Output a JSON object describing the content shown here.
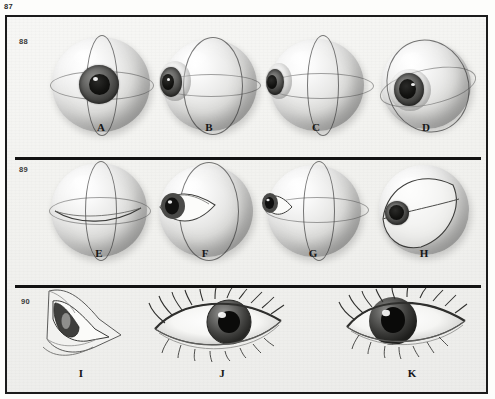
{
  "page": {
    "plate_number": "87",
    "background_color": "#f4f4f1",
    "border_color": "#1b1b1b"
  },
  "rows": [
    {
      "figure_number": "88",
      "description": "Eyeball globe rotations with meridian rings, front to lateral",
      "items": [
        {
          "label": "A",
          "view": "anterior-front",
          "iris_visible": true,
          "iris_position": "center"
        },
        {
          "label": "B",
          "view": "rotated-left",
          "iris_visible": true,
          "iris_position": "left-edge"
        },
        {
          "label": "C",
          "view": "rotated-far-left",
          "iris_visible": true,
          "iris_position": "far-left-edge"
        },
        {
          "label": "D",
          "view": "tilted-oblique",
          "iris_visible": true,
          "iris_position": "lower-left"
        }
      ]
    },
    {
      "figure_number": "89",
      "description": "Eyeball globe with palpebral aperture and lids in successive rotations",
      "items": [
        {
          "label": "E",
          "view": "posterior-no-aperture",
          "iris_visible": false,
          "iris_position": "none"
        },
        {
          "label": "F",
          "view": "aperture-three-quarter",
          "iris_visible": true,
          "iris_position": "left"
        },
        {
          "label": "G",
          "view": "aperture-lateral",
          "iris_visible": true,
          "iris_position": "far-left"
        },
        {
          "label": "H",
          "view": "lids-closed-oblique",
          "iris_visible": true,
          "iris_position": "lower-left"
        }
      ]
    },
    {
      "figure_number": "90",
      "description": "Surface anatomy of the eye with lids and lashes",
      "items": [
        {
          "label": "I",
          "view": "eye-lateral-construction",
          "iris_visible": true,
          "iris_position": "left"
        },
        {
          "label": "J",
          "view": "eye-frontal-finished",
          "iris_visible": true,
          "iris_position": "center"
        },
        {
          "label": "K",
          "view": "eye-three-quarter-finished",
          "iris_visible": true,
          "iris_position": "left-of-center"
        }
      ]
    }
  ],
  "colors": {
    "ink": "#171717",
    "rule": "#121212",
    "globe_highlight": "#ffffff",
    "globe_shadow": "#8f8f8d",
    "iris": "#4c4c4a",
    "pupil": "#0c0c0b"
  }
}
